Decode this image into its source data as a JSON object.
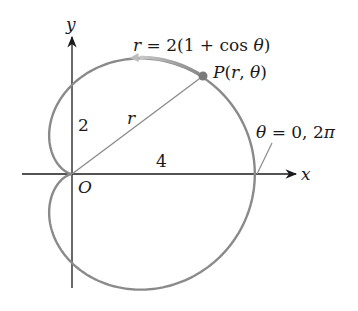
{
  "figure": {
    "type": "polar-curve",
    "curve_name": "cardioid",
    "equation_label": "r = 2(1 + cos θ)",
    "equation_parts": {
      "lhs": "r",
      "eq": " = 2(1 + cos ",
      "theta": "θ",
      "close": ")"
    },
    "point_label": "P(r, θ)",
    "point_parts": {
      "p": "P",
      "open": "(",
      "r": "r",
      "comma": ", ",
      "theta": "θ",
      "close": ")"
    },
    "radius_label": "r",
    "y_intercept_label": "2",
    "x_intercept_label": "4",
    "origin_label": "O",
    "angle_label": "θ = 0, 2π",
    "angle_parts": {
      "theta": "θ",
      "rest": " = 0, 2",
      "pi": "π"
    },
    "x_axis_label": "x",
    "y_axis_label": "y",
    "sample_point": {
      "theta_deg": 37,
      "r": 3.6
    },
    "colors": {
      "curve": "#8a8a8a",
      "axes": "#1a1a1a",
      "radius_line": "#8a8a8a",
      "point": "#7a7a7a",
      "direction_arrow": "#b0b0b0"
    }
  }
}
